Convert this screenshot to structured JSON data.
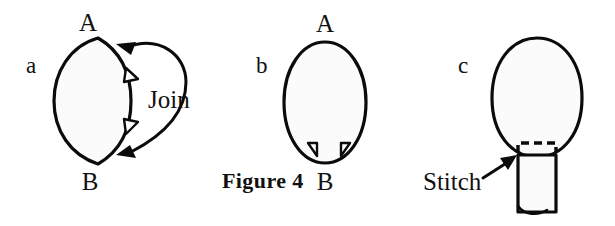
{
  "figure": {
    "caption": "Figure 4",
    "background_color": "#ffffff",
    "ink_color": "#0b0b0b",
    "panels": [
      {
        "letter": "a",
        "shape": "lens",
        "description": "lens / leaf shape formed by two arcs meeting at points A and B, with two outward triangular notches on the right arc",
        "vertex_top": "A",
        "vertex_bottom": "B",
        "annotation": "Join",
        "notch_count": 2
      },
      {
        "letter": "b",
        "shape": "circle",
        "description": "closed circle with two small triangular notches at the bottom near point B",
        "vertex_top": "A",
        "vertex_bottom": "B",
        "notch_count": 2
      },
      {
        "letter": "c",
        "shape": "circle-with-tube",
        "description": "circle with a cylindrical tube attached at the bottom; dashed line marks the seam",
        "annotation": "Stitch"
      }
    ]
  }
}
